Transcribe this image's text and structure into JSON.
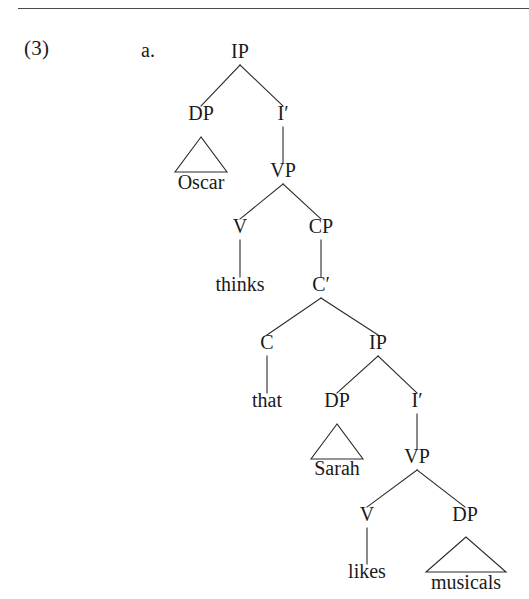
{
  "page": {
    "example_number": "(3)",
    "subexample_label": "a.",
    "has_top_rule": true,
    "ink_color": "#1a1a1a",
    "line_color": "#2b2b2b",
    "background_color": "#ffffff"
  },
  "tree": {
    "description": "Syntactic tree for 'Oscar thinks that Sarah likes musicals'",
    "sentence": "Oscar thinks that Sarah likes musicals",
    "nodes": [
      {
        "id": "IP1",
        "label": "IP",
        "x": 240,
        "y": 58,
        "kind": "nonterminal"
      },
      {
        "id": "DP1",
        "label": "DP",
        "x": 201,
        "y": 120,
        "kind": "nonterminal"
      },
      {
        "id": "Ibar1",
        "label": "I′",
        "x": 283,
        "y": 120,
        "kind": "nonterminal"
      },
      {
        "id": "Oscar",
        "label": "Oscar",
        "x": 201,
        "y": 189,
        "kind": "terminal"
      },
      {
        "id": "VP1",
        "label": "VP",
        "x": 283,
        "y": 177,
        "kind": "nonterminal"
      },
      {
        "id": "V1",
        "label": "V",
        "x": 240,
        "y": 233,
        "kind": "nonterminal"
      },
      {
        "id": "CP1",
        "label": "CP",
        "x": 321,
        "y": 233,
        "kind": "nonterminal"
      },
      {
        "id": "thinks",
        "label": "thinks",
        "x": 240,
        "y": 291,
        "kind": "terminal"
      },
      {
        "id": "Cbar1",
        "label": "C′",
        "x": 321,
        "y": 291,
        "kind": "nonterminal"
      },
      {
        "id": "C1",
        "label": "C",
        "x": 267,
        "y": 349,
        "kind": "nonterminal"
      },
      {
        "id": "IP2",
        "label": "IP",
        "x": 378,
        "y": 349,
        "kind": "nonterminal"
      },
      {
        "id": "that",
        "label": "that",
        "x": 267,
        "y": 407,
        "kind": "terminal"
      },
      {
        "id": "DP2",
        "label": "DP",
        "x": 337,
        "y": 407,
        "kind": "nonterminal"
      },
      {
        "id": "Ibar2",
        "label": "I′",
        "x": 417,
        "y": 407,
        "kind": "nonterminal"
      },
      {
        "id": "Sarah",
        "label": "Sarah",
        "x": 337,
        "y": 475,
        "kind": "terminal"
      },
      {
        "id": "VP2",
        "label": "VP",
        "x": 417,
        "y": 463,
        "kind": "nonterminal"
      },
      {
        "id": "V2",
        "label": "V",
        "x": 367,
        "y": 521,
        "kind": "nonterminal"
      },
      {
        "id": "DP3",
        "label": "DP",
        "x": 465,
        "y": 521,
        "kind": "nonterminal"
      },
      {
        "id": "likes",
        "label": "likes",
        "x": 367,
        "y": 578,
        "kind": "terminal"
      },
      {
        "id": "musicals",
        "label": "musicals",
        "x": 466,
        "y": 589,
        "kind": "terminal"
      }
    ],
    "branches": [
      {
        "from": "IP1",
        "to": "DP1",
        "type": "slant"
      },
      {
        "from": "IP1",
        "to": "Ibar1",
        "type": "slant"
      },
      {
        "from": "Ibar1",
        "to": "VP1",
        "type": "stem"
      },
      {
        "from": "VP1",
        "to": "V1",
        "type": "slant"
      },
      {
        "from": "VP1",
        "to": "CP1",
        "type": "slant"
      },
      {
        "from": "V1",
        "to": "thinks",
        "type": "stem"
      },
      {
        "from": "CP1",
        "to": "Cbar1",
        "type": "stem"
      },
      {
        "from": "Cbar1",
        "to": "C1",
        "type": "slant"
      },
      {
        "from": "Cbar1",
        "to": "IP2",
        "type": "slant"
      },
      {
        "from": "C1",
        "to": "that",
        "type": "stem"
      },
      {
        "from": "IP2",
        "to": "DP2",
        "type": "slant"
      },
      {
        "from": "IP2",
        "to": "Ibar2",
        "type": "slant"
      },
      {
        "from": "Ibar2",
        "to": "VP2",
        "type": "stem"
      },
      {
        "from": "VP2",
        "to": "V2",
        "type": "slant"
      },
      {
        "from": "VP2",
        "to": "DP3",
        "type": "slant"
      },
      {
        "from": "V2",
        "to": "likes",
        "type": "stem"
      }
    ],
    "triangles": [
      {
        "parent": "DP1",
        "terminal": "Oscar",
        "apex_x": 201,
        "apex_y": 137,
        "half_width": 26,
        "base_y": 172
      },
      {
        "parent": "DP2",
        "terminal": "Sarah",
        "apex_x": 337,
        "apex_y": 424,
        "half_width": 26,
        "base_y": 459
      },
      {
        "parent": "DP3",
        "terminal": "musicals",
        "apex_x": 466,
        "apex_y": 537,
        "half_width": 40,
        "base_y": 572
      }
    ]
  }
}
